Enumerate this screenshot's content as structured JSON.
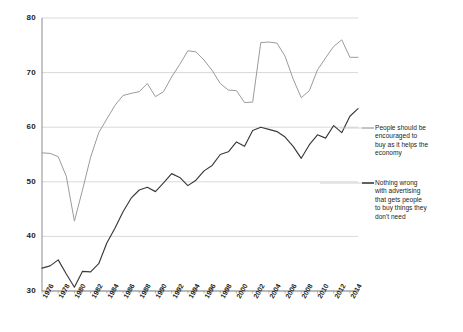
{
  "chart_data": {
    "type": "line",
    "title": "",
    "subtitle": "",
    "xlabel": "",
    "ylabel": "",
    "xlim": [
      1976,
      2015
    ],
    "ylim": [
      30,
      80
    ],
    "yticks": [
      30,
      40,
      50,
      60,
      70,
      80
    ],
    "grid": "horizontal",
    "legend_position": "right",
    "x": [
      1976,
      1977,
      1978,
      1979,
      1980,
      1981,
      1982,
      1983,
      1984,
      1985,
      1986,
      1987,
      1988,
      1989,
      1990,
      1991,
      1992,
      1993,
      1994,
      1995,
      1996,
      1997,
      1998,
      1999,
      2000,
      2001,
      2002,
      2003,
      2004,
      2005,
      2006,
      2007,
      2008,
      2009,
      2010,
      2011,
      2012,
      2013,
      2014,
      2015
    ],
    "xtick_labels": [
      "1976",
      "1978",
      "1980",
      "1982",
      "1984",
      "1986",
      "1988",
      "1990",
      "1992",
      "1994",
      "1996",
      "1998",
      "2000",
      "2002",
      "2004",
      "2006",
      "2008",
      "2010",
      "2012",
      "2014"
    ],
    "series": [
      {
        "name": "People should be encouraged to buy as it helps the economy",
        "color": "#9b9b9b",
        "values": [
          55.3,
          55.2,
          54.6,
          51.0,
          42.8,
          48.5,
          54.5,
          59.0,
          61.5,
          64.0,
          65.8,
          66.2,
          66.5,
          68.0,
          65.6,
          66.5,
          69.2,
          71.5,
          74.0,
          73.8,
          72.3,
          70.4,
          68.0,
          66.8,
          66.7,
          64.5,
          64.6,
          75.5,
          75.6,
          75.4,
          73.0,
          68.8,
          65.4,
          66.7,
          70.5,
          72.7,
          74.8,
          76.0,
          72.8,
          72.8
        ]
      },
      {
        "name": "Nothing wrong with advertising that gets people to buy things they don't need",
        "color": "#3a3a3a",
        "values": [
          34.2,
          34.6,
          35.7,
          33.1,
          30.7,
          33.6,
          33.5,
          35.0,
          38.8,
          41.5,
          44.5,
          47.0,
          48.5,
          49.0,
          48.2,
          49.8,
          51.5,
          50.8,
          49.3,
          50.3,
          52.0,
          53.0,
          55.0,
          55.5,
          57.3,
          56.5,
          59.4,
          60.0,
          59.6,
          59.2,
          58.2,
          56.5,
          54.3,
          56.8,
          58.6,
          58.0,
          60.3,
          59.0,
          62.0,
          63.4
        ]
      }
    ],
    "legend": [
      {
        "label": "People should be\nencouraged to\nbuy as it helps the\neconomy",
        "color": "#9b9b9b"
      },
      {
        "label": "Nothing wrong\nwith advertising\nthat gets people\nto buy things they\ndon't need",
        "color": "#3a3a3a"
      }
    ]
  },
  "axis": {
    "y_label_values": [
      "80",
      "70",
      "60",
      "50",
      "40",
      "30"
    ]
  }
}
